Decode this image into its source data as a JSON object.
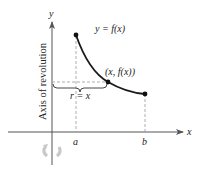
{
  "diagram": {
    "type": "shell-method-illustration",
    "axes": {
      "x_label": "x",
      "y_label": "y",
      "vertical_axis_caption": "Axis of revolution"
    },
    "curve": {
      "label": "y = f(x)",
      "point_label": "(x, f(x))",
      "start_label": "a",
      "end_label": "b"
    },
    "radius": {
      "label": "r = x"
    },
    "icons": {
      "rotation": "rotation-arrow-icon"
    },
    "colors": {
      "axis": "#555555",
      "curve": "#1a1a1a",
      "dashed": "#999999",
      "rotation_icon": "#c8c8c8",
      "background": "#ffffff"
    }
  }
}
